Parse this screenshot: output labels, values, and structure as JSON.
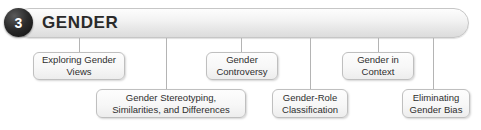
{
  "header": {
    "chapter_number": "3",
    "title": "GENDER",
    "badge_color": "#151515",
    "bar_color": "#eeeeee",
    "border_color": "#c6c6c6"
  },
  "diagram": {
    "type": "chapter-outline-tree",
    "connector_color": "#b4b4b4",
    "node_border_color": "#bfbfbf",
    "node_fill_color": "#f7f7f7",
    "nodes": [
      {
        "id": "exploring-gender-views",
        "label": "Exploring Gender\nViews",
        "row": "upper",
        "x": 33,
        "y": 52,
        "w": 92,
        "h": 28,
        "connector_x": 79,
        "connector_top": 38,
        "connector_bottom": 52
      },
      {
        "id": "gender-stereotyping",
        "label": "Gender Stereotyping,\nSimilarities, and Differences",
        "row": "lower",
        "x": 96,
        "y": 89,
        "w": 150,
        "h": 29,
        "connector_x": 166,
        "connector_top": 38,
        "connector_bottom": 89
      },
      {
        "id": "gender-controversy",
        "label": "Gender\nControversy",
        "row": "upper",
        "x": 206,
        "y": 52,
        "w": 72,
        "h": 28,
        "connector_x": 241,
        "connector_top": 38,
        "connector_bottom": 52
      },
      {
        "id": "gender-role-classification",
        "label": "Gender-Role\nClassification",
        "row": "lower",
        "x": 272,
        "y": 89,
        "w": 76,
        "h": 29,
        "connector_x": 310,
        "connector_top": 38,
        "connector_bottom": 89
      },
      {
        "id": "gender-in-context",
        "label": "Gender in\nContext",
        "row": "upper",
        "x": 342,
        "y": 52,
        "w": 72,
        "h": 28,
        "connector_x": 378,
        "connector_top": 38,
        "connector_bottom": 52
      },
      {
        "id": "eliminating-gender-bias",
        "label": "Eliminating\nGender Bias",
        "row": "lower",
        "x": 402,
        "y": 89,
        "w": 68,
        "h": 29,
        "connector_x": 433,
        "connector_top": 38,
        "connector_bottom": 89
      }
    ]
  }
}
